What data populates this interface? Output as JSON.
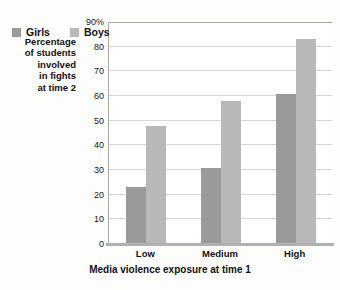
{
  "chart_data": {
    "type": "bar",
    "title": "",
    "categories": [
      "Low",
      "Medium",
      "High"
    ],
    "series": [
      {
        "name": "Girls",
        "values": [
          23,
          31,
          61
        ],
        "color": "#9a9a9a"
      },
      {
        "name": "Boys",
        "values": [
          48,
          58,
          83
        ],
        "color": "#b8b8b8"
      }
    ],
    "xlabel": "Media violence exposure at time 1",
    "ylabel": "Percentage of students involved in fights at time 2",
    "ylabel_lines": [
      "Percentage",
      "of students",
      "involved",
      "in fights",
      "at time 2"
    ],
    "ylim": [
      0,
      90
    ],
    "ytick_values": [
      0,
      10,
      20,
      30,
      40,
      50,
      60,
      70,
      80,
      90
    ],
    "ytick_labels": [
      "0",
      "10",
      "20",
      "30",
      "40",
      "50",
      "60",
      "70",
      "80",
      "90%"
    ],
    "grid": true,
    "legend_position": "inside-top-left",
    "legend_entries": [
      "Girls",
      "Boys"
    ]
  },
  "axis": {
    "y_title_lines": [
      "Percentage",
      "of students",
      "involved",
      "in fights",
      "at time 2"
    ],
    "x_title": "Media violence exposure at time 1"
  },
  "legend": {
    "girls_label": "Girls",
    "boys_label": "Boys"
  },
  "ticks": {
    "y": [
      "90%",
      "80",
      "70",
      "60",
      "50",
      "40",
      "30",
      "20",
      "10",
      "0"
    ],
    "x": [
      "Low",
      "Medium",
      "High"
    ]
  },
  "colors": {
    "girls": "#9a9a9a",
    "boys": "#b8b8b8",
    "gridline": "#d6d6d6",
    "axis": "#a8a8a8",
    "background": "#fdfdfb"
  }
}
